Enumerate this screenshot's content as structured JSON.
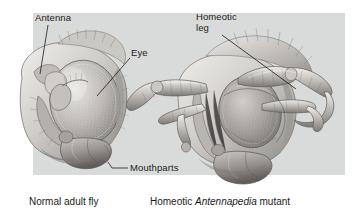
{
  "figure": {
    "kind": "biology-illustration",
    "panel_color": "#d9dbda",
    "ink_color": "#1b1b1b"
  },
  "labels": {
    "antenna": "Antenna",
    "eye": "Eye",
    "homeotic_leg_line1": "Homeotic",
    "homeotic_leg_line2": "leg",
    "mouthparts": "Mouthparts"
  },
  "captions": {
    "left": "Normal adult fly",
    "right_prefix": "Homeotic ",
    "right_italic": "Antennapedia",
    "right_suffix": " mutant"
  },
  "specimens": [
    {
      "name": "normal-adult-fly",
      "caption": "Normal adult fly",
      "parts": [
        "Antenna",
        "Eye",
        "Mouthparts"
      ]
    },
    {
      "name": "antennapedia-mutant",
      "caption": "Homeotic Antennapedia mutant",
      "parts": [
        "Homeotic leg",
        "Eye",
        "Mouthparts"
      ]
    }
  ]
}
